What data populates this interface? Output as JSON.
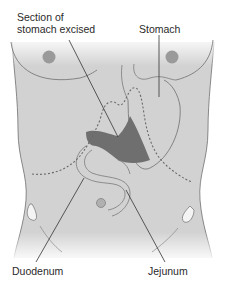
{
  "diagram": {
    "labels": {
      "excised_line1": "Section of",
      "excised_line2": "stomach excised",
      "stomach": "Stomach",
      "duodenum": "Duodenum",
      "jejunum": "Jejunum"
    },
    "colors": {
      "body_fill": "#d2d2d2",
      "outline": "#6e6e6e",
      "excised_region": "#6f6f6f",
      "nipple": "#9a9a9a",
      "dashed_line": "#6a6a6a",
      "leader_line": "#333333",
      "text": "#2a2a2a"
    }
  }
}
